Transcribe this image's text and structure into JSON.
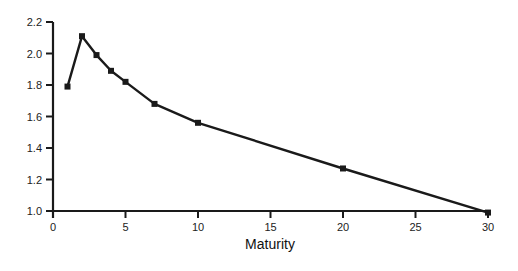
{
  "chart_data": {
    "type": "line",
    "title": "",
    "xlabel": "Maturity",
    "ylabel": "",
    "xlim": [
      0,
      30
    ],
    "ylim": [
      1.0,
      2.2
    ],
    "grid": false,
    "legend": null,
    "x_ticks": [
      0,
      5,
      10,
      15,
      20,
      25,
      30
    ],
    "y_ticks": [
      1.0,
      1.2,
      1.4,
      1.6,
      1.8,
      2.0,
      2.2
    ],
    "x_tick_labels": [
      "0",
      "5",
      "10",
      "15",
      "20",
      "25",
      "30"
    ],
    "y_tick_labels": [
      "1.0",
      "1.2",
      "1.4",
      "1.6",
      "1.8",
      "2.0",
      "2.2"
    ],
    "series": [
      {
        "name": "series-1",
        "marker": "square",
        "color": "#1a1a1a",
        "x": [
          1,
          2,
          3,
          4,
          5,
          7,
          10,
          20,
          30
        ],
        "values": [
          1.79,
          2.11,
          1.99,
          1.89,
          1.82,
          1.68,
          1.56,
          1.27,
          0.99
        ]
      }
    ]
  }
}
